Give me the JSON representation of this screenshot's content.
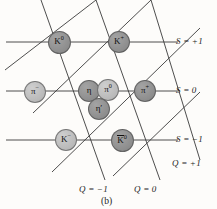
{
  "figure": {
    "caption": "(b)",
    "background": "#fdfcfa",
    "line_color": "#3a3a3a",
    "node_fill_dark": "#8d8d8d",
    "node_fill_light": "#b9b9b9",
    "text_color": "#1c1c1c"
  },
  "nodes": [
    {
      "id": "K0",
      "label": "K",
      "sup": "0",
      "overline": false,
      "x": 59,
      "y": 42,
      "r": 11.5,
      "shade": "dark"
    },
    {
      "id": "Kplus",
      "label": "K",
      "sup": "+",
      "overline": false,
      "x": 119,
      "y": 42,
      "r": 11.0,
      "shade": "dark"
    },
    {
      "id": "piminus",
      "label": "π",
      "sup": "−",
      "overline": false,
      "x": 35,
      "y": 92,
      "r": 11.0,
      "shade": "light"
    },
    {
      "id": "eta",
      "label": "η",
      "sup": "",
      "overline": false,
      "x": 89,
      "y": 91,
      "r": 11.0,
      "shade": "dark"
    },
    {
      "id": "pi0",
      "label": "π",
      "sup": "0",
      "overline": false,
      "x": 108,
      "y": 90,
      "r": 11.0,
      "shade": "light"
    },
    {
      "id": "etaprime",
      "label": "η′",
      "sup": "",
      "overline": false,
      "x": 99,
      "y": 109,
      "r": 11.0,
      "shade": "dark"
    },
    {
      "id": "piplus",
      "label": "π",
      "sup": "+",
      "overline": false,
      "x": 145,
      "y": 91,
      "r": 11.0,
      "shade": "dark"
    },
    {
      "id": "Kminus",
      "label": "K",
      "sup": "−",
      "overline": false,
      "x": 66,
      "y": 140,
      "r": 11.0,
      "shade": "light"
    },
    {
      "id": "K0bar",
      "label": "K",
      "sup": "0",
      "overline": true,
      "x": 122,
      "y": 140,
      "r": 11.5,
      "shade": "dark"
    }
  ],
  "axis_labels": {
    "s_plus_one": "S = +1",
    "s_zero": "S = 0",
    "s_minus_one": "S = −1",
    "q_plus_one": "Q = +1",
    "q_minus_one": "Q = −1",
    "q_zero": "Q = 0"
  },
  "chart_data": {
    "type": "scatter",
    "xlabel": "Q (electric charge)",
    "ylabel": "S (strangeness)",
    "grid": true,
    "legend": "none",
    "x": [
      0,
      1,
      -1,
      0,
      0,
      0,
      1,
      -1,
      0
    ],
    "y": [
      1,
      1,
      0,
      0,
      0,
      0,
      0,
      -1,
      -1
    ],
    "labels": [
      "K0",
      "K+",
      "π−",
      "η",
      "π0",
      "η′",
      "π+",
      "K−",
      "K̅0"
    ],
    "xlim": [
      -1.6,
      1.6
    ],
    "ylim": [
      -1.6,
      1.6
    ],
    "xticks": [
      -1,
      0,
      1
    ],
    "xticklabels": [
      "Q = −1",
      "Q = 0",
      "Q = +1"
    ],
    "yticks": [
      -1,
      0,
      1
    ],
    "yticklabels": [
      "S = −1",
      "S = 0",
      "S = +1"
    ]
  }
}
